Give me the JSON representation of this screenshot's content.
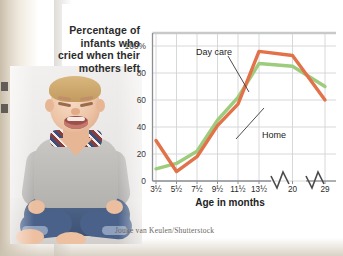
{
  "figure": {
    "title_lines": [
      "Percentage of",
      "infants who",
      "cried when their",
      "mothers left"
    ],
    "credit": "Jouke van Keulen/Shutterstock",
    "photo_alt": "crying-infant-photo"
  },
  "colors": {
    "home_line": "#E2724A",
    "day_care_line": "#9DCC7D",
    "grid": "#d2d4d6",
    "axis": "#8c9095",
    "text": "#2b2b2b",
    "card": "#ffffff"
  },
  "chart_data": {
    "type": "line",
    "title": "Percentage of infants who cried when their mothers left",
    "xlabel": "Age in months",
    "ylabel": "",
    "categories": [
      "3½",
      "5½",
      "7½",
      "9½",
      "11½",
      "13½",
      "20",
      "29"
    ],
    "ytick_labels": [
      "0",
      "20",
      "40",
      "60",
      "80",
      "100%"
    ],
    "ytick_values": [
      0,
      20,
      40,
      60,
      80,
      100
    ],
    "ylim": [
      0,
      100
    ],
    "grid": true,
    "axis_break": {
      "between": [
        "13½",
        "20"
      ],
      "style": "zigzag"
    },
    "legend_position": "inline-callout",
    "series": [
      {
        "name": "Day care",
        "color": "#9DCC7D",
        "values": [
          9,
          13,
          22,
          45,
          62,
          87,
          85,
          70
        ]
      },
      {
        "name": "Home",
        "color": "#E2724A",
        "values": [
          30,
          7,
          18,
          41,
          57,
          96,
          93,
          60
        ]
      }
    ],
    "annotations": [
      {
        "text": "Day care",
        "points_to_series": "Day care"
      },
      {
        "text": "Home",
        "points_to_series": "Home"
      }
    ]
  }
}
